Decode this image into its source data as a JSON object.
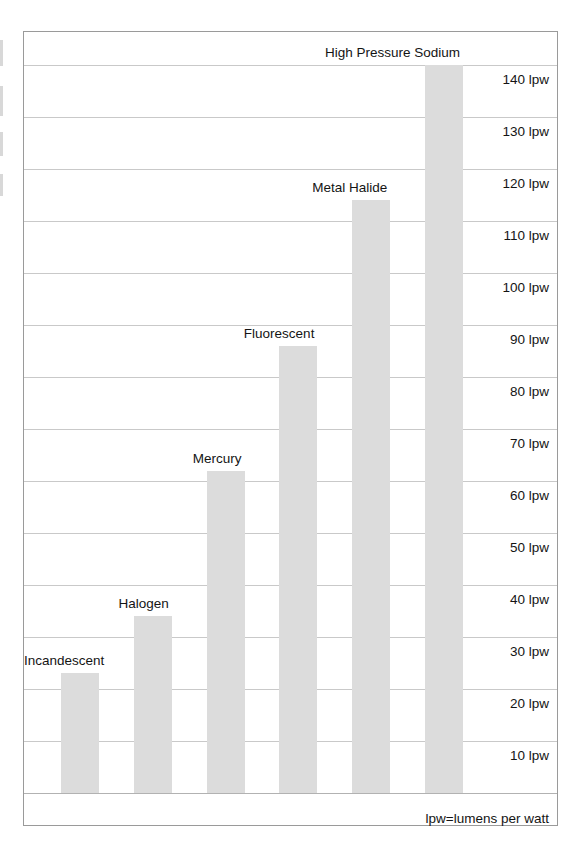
{
  "chart_data": {
    "type": "bar",
    "title": "",
    "xlabel": "",
    "ylabel": "lpw",
    "ylim": [
      0,
      145
    ],
    "grid": true,
    "legend_position": "none",
    "unit": "lpw",
    "footnote": "lpw=lumens per watt",
    "categories": [
      "Incandescent",
      "Halogen",
      "Mercury",
      "Fluorescent",
      "Metal Halide",
      "High Pressure Sodium"
    ],
    "values": [
      23,
      34,
      62,
      86,
      114,
      140
    ],
    "tick_labels": [
      "10 lpw",
      "20 lpw",
      "30 lpw",
      "40 lpw",
      "50 lpw",
      "60 lpw",
      "70 lpw",
      "80 lpw",
      "90 lpw",
      "100 lpw",
      "110 lpw",
      "120 lpw",
      "130 lpw",
      "140 lpw"
    ],
    "tick_values": [
      10,
      20,
      30,
      40,
      50,
      60,
      70,
      80,
      90,
      100,
      110,
      120,
      130,
      140
    ],
    "colors": {
      "bar_fill": "#dcdcdc",
      "gridline": "#c9c9c9",
      "frame": "#9a9a9a",
      "text": "#141414",
      "background": "#ffffff"
    }
  },
  "bars": [
    {
      "label": "Incandescent",
      "value": 23,
      "value_label": "23 lpw"
    },
    {
      "label": "Halogen",
      "value": 34,
      "value_label": "34 lpw"
    },
    {
      "label": "Mercury",
      "value": 62,
      "value_label": "62 lpw"
    },
    {
      "label": "Fluorescent",
      "value": 86,
      "value_label": "86 lpw"
    },
    {
      "label": "Metal Halide",
      "value": 114,
      "value_label": "114 lpw"
    },
    {
      "label": "High Pressure Sodium",
      "value": 140,
      "value_label": "140 lpw"
    }
  ],
  "ticks": [
    {
      "label": "10 lpw",
      "value": 10
    },
    {
      "label": "20 lpw",
      "value": 20
    },
    {
      "label": "30 lpw",
      "value": 30
    },
    {
      "label": "40 lpw",
      "value": 40
    },
    {
      "label": "50 lpw",
      "value": 50
    },
    {
      "label": "60 lpw",
      "value": 60
    },
    {
      "label": "70 lpw",
      "value": 70
    },
    {
      "label": "80 lpw",
      "value": 80
    },
    {
      "label": "90 lpw",
      "value": 90
    },
    {
      "label": "100 lpw",
      "value": 100
    },
    {
      "label": "110 lpw",
      "value": 110
    },
    {
      "label": "120 lpw",
      "value": 120
    },
    {
      "label": "130 lpw",
      "value": 130
    },
    {
      "label": "140 lpw",
      "value": 140
    }
  ],
  "footnote": "lpw=lumens per watt"
}
